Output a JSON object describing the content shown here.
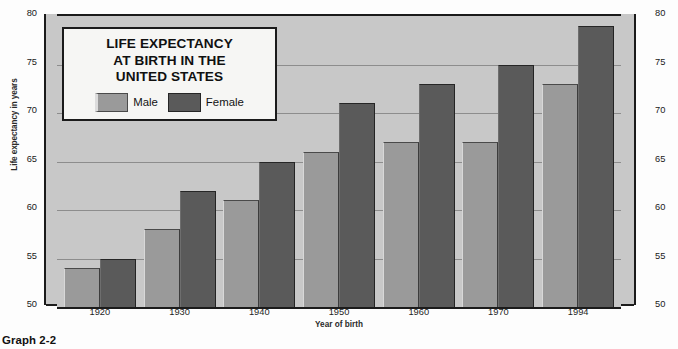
{
  "caption": "Graph 2-2",
  "title": {
    "lines": [
      "LIFE EXPECTANCY",
      "AT BIRTH IN THE",
      "UNITED STATES"
    ]
  },
  "legend": {
    "entries": [
      {
        "label": "Male",
        "color": "#9a9a9a",
        "swatch": "male-swatch"
      },
      {
        "label": "Female",
        "color": "#5a5a5a",
        "swatch": "female-swatch"
      }
    ]
  },
  "axes": {
    "y_label": "Life expectancy in years",
    "x_label": "Year of birth",
    "y_major_ticks": [
      "80",
      "75",
      "70",
      "65",
      "60",
      "55",
      "50"
    ],
    "y_min": 50,
    "y_max": 80,
    "y_minor_step": 1
  },
  "chart_data": {
    "type": "bar",
    "title": "LIFE EXPECTANCY AT BIRTH IN THE UNITED STATES",
    "xlabel": "Year of birth",
    "ylabel": "Life expectancy in years",
    "ylim": [
      50,
      80
    ],
    "ytick_values": [
      50,
      55,
      60,
      65,
      70,
      75,
      80
    ],
    "grid": true,
    "grid_axis": "y",
    "legend_position": "inside-upper-left",
    "categories": [
      "1920",
      "1930",
      "1940",
      "1950",
      "1960",
      "1970",
      "1994"
    ],
    "series": [
      {
        "name": "Male",
        "color": "#9a9a9a",
        "values": [
          54,
          58,
          61,
          66,
          67,
          67,
          73
        ]
      },
      {
        "name": "Female",
        "color": "#5a5a5a",
        "values": [
          55,
          62,
          65,
          71,
          73,
          75,
          79
        ]
      }
    ]
  },
  "colors": {
    "plot_background": "#c8c8c8",
    "axis_line": "#1b1b1b",
    "gridline": "#8d8d8d",
    "title_box_background": "#f6f6f4"
  }
}
